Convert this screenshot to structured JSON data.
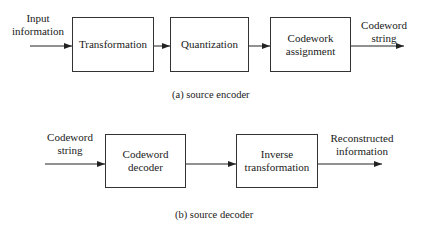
{
  "encoder": {
    "input_label": [
      "Input",
      "information"
    ],
    "blocks": [
      {
        "lines": [
          "Transformation"
        ]
      },
      {
        "lines": [
          "Quantization"
        ]
      },
      {
        "lines": [
          "Codework",
          "assignment"
        ]
      }
    ],
    "output_label": [
      "Codeword",
      "string"
    ],
    "caption": "(a) source encoder"
  },
  "decoder": {
    "input_label": [
      "Codeword",
      "string"
    ],
    "blocks": [
      {
        "lines": [
          "Codeword",
          "decoder"
        ]
      },
      {
        "lines": [
          "Inverse",
          "transformation"
        ]
      }
    ],
    "output_label": [
      "Reconstructed",
      "information"
    ],
    "caption": "(b) source decoder"
  },
  "colors": {
    "line": "#222222",
    "box_border": "#333333",
    "background": "#ffffff"
  }
}
